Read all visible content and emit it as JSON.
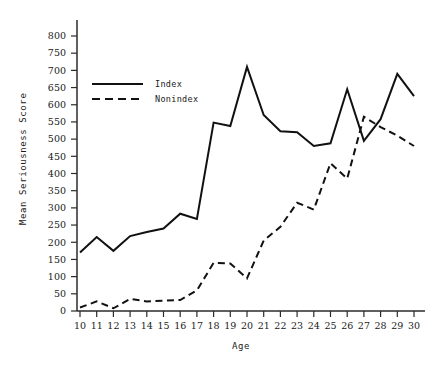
{
  "chart_data": {
    "type": "line",
    "title": "",
    "xlabel": "Age",
    "ylabel": "Mean Seriousness Score",
    "x": [
      10,
      11,
      12,
      13,
      14,
      15,
      16,
      17,
      18,
      19,
      20,
      21,
      22,
      23,
      24,
      25,
      26,
      27,
      28,
      29,
      30
    ],
    "xtick_labels": [
      "10",
      "11",
      "12",
      "13",
      "14",
      "15",
      "16",
      "17",
      "18",
      "19",
      "20",
      "21",
      "22",
      "23",
      "24",
      "25",
      "26",
      "27",
      "28",
      "29",
      "30"
    ],
    "ytick_labels": [
      "0",
      "50",
      "100",
      "150",
      "200",
      "250",
      "300",
      "350",
      "400",
      "450",
      "500",
      "550",
      "600",
      "650",
      "700",
      "750",
      "800"
    ],
    "yticks": [
      0,
      50,
      100,
      150,
      200,
      250,
      300,
      350,
      400,
      450,
      500,
      550,
      600,
      650,
      700,
      750,
      800
    ],
    "xlim": [
      10,
      30
    ],
    "ylim": [
      0,
      800
    ],
    "grid": false,
    "legend_position": "upper-left-inside",
    "series": [
      {
        "name": "Index",
        "style": "solid",
        "color": "#111111",
        "values": [
          170,
          215,
          175,
          218,
          230,
          240,
          283,
          268,
          548,
          538,
          710,
          570,
          523,
          520,
          480,
          488,
          645,
          495,
          558,
          690,
          625
        ]
      },
      {
        "name": "Nonindex",
        "style": "dashed",
        "color": "#111111",
        "values": [
          10,
          28,
          8,
          35,
          28,
          30,
          32,
          60,
          140,
          138,
          95,
          205,
          245,
          315,
          295,
          430,
          385,
          565,
          535,
          510,
          480
        ]
      }
    ]
  },
  "legend": {
    "entries": [
      {
        "label": "Index"
      },
      {
        "label": "Nonindex"
      }
    ]
  },
  "axes": {
    "x_title": "Age",
    "y_title": "Mean Seriousness Score"
  }
}
